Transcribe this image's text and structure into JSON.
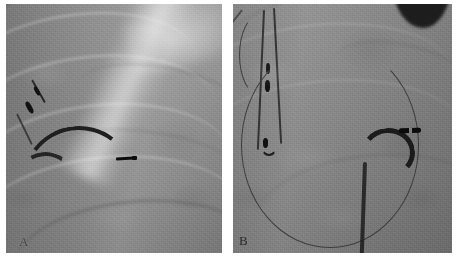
{
  "figure": {
    "type": "fluoroscopy-image-pair",
    "modality": "X-ray fluoroscopy",
    "orientation": "side-by-side",
    "background_color": "#ffffff",
    "panel_count": 2
  },
  "panels": [
    {
      "id": "A",
      "label": "A",
      "label_position": "bottom-left",
      "base_gray": "#8f8f8f",
      "anatomy_notes": "chest fluoroscopy with rib shadows and bright mediastinal band upper-right",
      "devices": [
        {
          "name": "pacing-lead",
          "description": "lead with two radiopaque electrode markers, upper-left",
          "color": "#111111"
        },
        {
          "name": "curved-catheter",
          "description": "dark curved catheter sweeping left to right with radiopaque tip marker",
          "color": "#1e1e1e"
        },
        {
          "name": "catheter-tip-marker",
          "description": "short dense radiopaque tip band at distal catheter end",
          "color": "#0c0c0c"
        }
      ]
    },
    {
      "id": "B",
      "label": "B",
      "label_position": "bottom-left",
      "base_gray": "#898989",
      "anatomy_notes": "chest fluoroscopy with dark device shadow at top-right corner",
      "devices": [
        {
          "name": "looped-lead",
          "description": "lead folded into a narrow vertical loop with three electrode markers",
          "color": "#111111"
        },
        {
          "name": "guidewire-loop",
          "description": "thin guidewire forming a large U-shaped loop across lower half",
          "color": "#3a3a3a"
        },
        {
          "name": "hooked-catheter",
          "description": "dark catheter with hooked distal curve and radiopaque tip marker",
          "color": "#1e1e1e"
        },
        {
          "name": "device-shadow",
          "description": "dark crescent shadow of implanted device at top-right corner",
          "color": "#1d1d1d"
        }
      ]
    }
  ],
  "colors": {
    "page_background": "#ffffff",
    "panel_a_gray": "#8f8f8f",
    "panel_b_gray": "#898989",
    "device_dark": "#111111",
    "marker_black": "#0c0c0c",
    "label_text": "#2a2a2a"
  }
}
